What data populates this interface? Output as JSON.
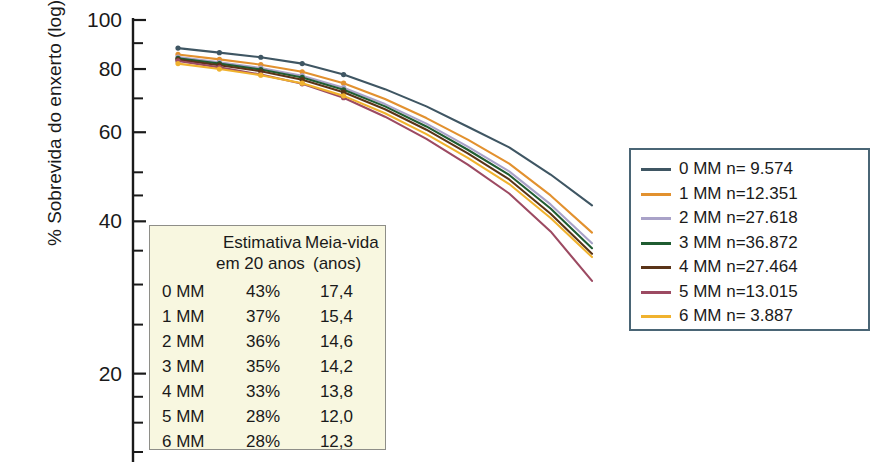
{
  "chart_data": {
    "type": "line",
    "title": "",
    "xlabel": "",
    "ylabel": "% Sobrevida do enxerto (log)",
    "yscale": "log",
    "ylim": [
      14,
      100
    ],
    "xlim": [
      0,
      10
    ],
    "grid": false,
    "legend_position": "right",
    "y_ticks_labeled": [
      100,
      80,
      60,
      40,
      20
    ],
    "y_ticks_minor": [
      90,
      70,
      50,
      45,
      35,
      30,
      25,
      18,
      16,
      14
    ],
    "series": [
      {
        "name": "0 MM",
        "n": "9.574",
        "color": "#3f5663",
        "estimate_20y": "43%",
        "half_life": "17,4",
        "x": [
          0,
          1,
          2,
          3,
          4,
          5,
          6,
          7,
          8,
          9,
          10
        ],
        "y": [
          88,
          86.2,
          84.4,
          82.0,
          78.0,
          73.0,
          67.5,
          61.5,
          56.0,
          49.5,
          43.0
        ]
      },
      {
        "name": "1 MM",
        "n": "12.351",
        "color": "#e2912f",
        "estimate_20y": "37%",
        "half_life": "15,4",
        "x": [
          0,
          1,
          2,
          3,
          4,
          5,
          6,
          7,
          8,
          9,
          10
        ],
        "y": [
          85.5,
          83.6,
          81.6,
          79.0,
          75.0,
          69.8,
          64.0,
          58.0,
          52.0,
          45.0,
          38.0
        ]
      },
      {
        "name": "2 MM",
        "n": "27.618",
        "color": "#a9a2c8",
        "estimate_20y": "36%",
        "half_life": "14,6",
        "x": [
          0,
          1,
          2,
          3,
          4,
          5,
          6,
          7,
          8,
          9,
          10
        ],
        "y": [
          84.5,
          82.5,
          80.4,
          77.6,
          73.5,
          68.2,
          62.4,
          56.2,
          50.2,
          43.2,
          36.2
        ]
      },
      {
        "name": "3 MM",
        "n": "36.872",
        "color": "#1f5c31",
        "estimate_20y": "35%",
        "half_life": "14,2",
        "x": [
          0,
          1,
          2,
          3,
          4,
          5,
          6,
          7,
          8,
          9,
          10
        ],
        "y": [
          84.0,
          82.0,
          79.8,
          77.0,
          72.8,
          67.5,
          61.6,
          55.4,
          49.4,
          42.4,
          35.4
        ]
      },
      {
        "name": "4 MM",
        "n": "27.464",
        "color": "#5a3418",
        "estimate_20y": "33%",
        "half_life": "13,8",
        "x": [
          0,
          1,
          2,
          3,
          4,
          5,
          6,
          7,
          8,
          9,
          10
        ],
        "y": [
          83.5,
          81.4,
          79.2,
          76.2,
          72.0,
          66.6,
          60.7,
          54.5,
          48.4,
          41.4,
          34.5
        ]
      },
      {
        "name": "5 MM",
        "n": "13.015",
        "color": "#9c4a62",
        "estimate_20y": "28%",
        "half_life": "12,0",
        "x": [
          0,
          1,
          2,
          3,
          4,
          5,
          6,
          7,
          8,
          9,
          10
        ],
        "y": [
          83.0,
          80.6,
          78.0,
          74.8,
          70.2,
          64.4,
          58.2,
          51.8,
          45.4,
          38.2,
          30.5
        ]
      },
      {
        "name": "6 MM",
        "n": "3.887",
        "color": "#f0b22e",
        "estimate_20y": "28%",
        "half_life": "12,3",
        "x": [
          0,
          1,
          2,
          3,
          4,
          5,
          6,
          7,
          8,
          9,
          10
        ],
        "y": [
          82.0,
          80.0,
          77.8,
          75.0,
          70.8,
          65.4,
          59.5,
          53.4,
          47.4,
          40.6,
          34.0
        ]
      }
    ]
  },
  "inset_table": {
    "header": {
      "col1_line1": "Estimativa",
      "col1_line2": "em 20 anos",
      "col2_line1": "Meia-vida",
      "col2_line2": "(anos)"
    },
    "rows": [
      {
        "label": "0 MM",
        "estimate": "43%",
        "half_life": "17,4"
      },
      {
        "label": "1 MM",
        "estimate": "37%",
        "half_life": "15,4"
      },
      {
        "label": "2 MM",
        "estimate": "36%",
        "half_life": "14,6"
      },
      {
        "label": "3 MM",
        "estimate": "35%",
        "half_life": "14,2"
      },
      {
        "label": "4 MM",
        "estimate": "33%",
        "half_life": "13,8"
      },
      {
        "label": "5 MM",
        "estimate": "28%",
        "half_life": "12,0"
      },
      {
        "label": "6 MM",
        "estimate": "28%",
        "half_life": "12,3"
      }
    ]
  },
  "legend": {
    "items": [
      {
        "label": "0 MM n=  9.574",
        "color": "#3f5663"
      },
      {
        "label": "1 MM n=12.351",
        "color": "#e2912f"
      },
      {
        "label": "2 MM n=27.618",
        "color": "#a9a2c8"
      },
      {
        "label": "3 MM n=36.872",
        "color": "#1f5c31"
      },
      {
        "label": "4 MM n=27.464",
        "color": "#5a3418"
      },
      {
        "label": "5 MM n=13.015",
        "color": "#9c4a62"
      },
      {
        "label": "6 MM n=  3.887",
        "color": "#f0b22e"
      }
    ],
    "border_color": "#4a6575"
  },
  "axis": {
    "y_label": "% Sobrevida do enxerto (log)",
    "tick_labels": [
      "100",
      "80",
      "60",
      "40",
      "20"
    ],
    "axis_color": "#1a1a1a"
  }
}
